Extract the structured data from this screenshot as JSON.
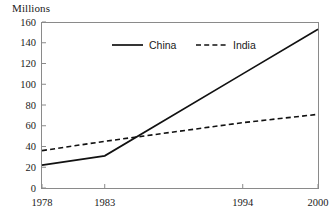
{
  "chart_data": {
    "type": "line",
    "title": "",
    "subtitle": "",
    "xlabel": "",
    "ylabel": "Millions",
    "x": [
      1978,
      1983,
      1994,
      2000
    ],
    "categories": [
      "1978",
      "1983",
      "1994",
      "2000"
    ],
    "series": [
      {
        "name": "China",
        "style": "solid",
        "color": "#111111",
        "values": [
          22,
          31,
          110,
          153
        ]
      },
      {
        "name": "India",
        "style": "dashed",
        "color": "#111111",
        "values": [
          36,
          45,
          63,
          71
        ]
      }
    ],
    "ylim": [
      0,
      160
    ],
    "ytick_labels": [
      "0",
      "20",
      "40",
      "60",
      "80",
      "100",
      "120",
      "140",
      "160"
    ],
    "ytick_values": [
      0,
      20,
      40,
      60,
      80,
      100,
      120,
      140,
      160
    ],
    "xtick_labels": [
      "1978",
      "1983",
      "1994",
      "2000"
    ],
    "grid": false,
    "legend_position": "top-center-inside",
    "axis_color": "#8a8a8a",
    "background": "#ffffff"
  },
  "legend": {
    "china_label": "China",
    "india_label": "India"
  },
  "axis": {
    "y_axis_title": "Millions"
  }
}
